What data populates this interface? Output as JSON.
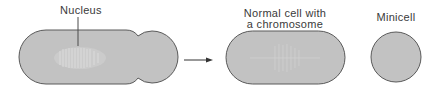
{
  "diagram": {
    "labels": {
      "nucleus": "Nucleus",
      "normal_cell_line1": "Normal cell with",
      "normal_cell_line2": "a chromosome",
      "minicell": "Minicell"
    },
    "stages": [
      {
        "id": "dividing-cell",
        "description": "Dividing cell with nucleus, constricting near one pole"
      },
      {
        "id": "products",
        "description": "Normal cell with a chromosome and an anucleate minicell"
      }
    ],
    "colors": {
      "cell_fill": "#c2c2c2",
      "cell_stroke": "#5a5a5a",
      "nucleus_texture": "#e2e2e2",
      "arrow": "#333333",
      "text": "#3a3a3a"
    }
  }
}
